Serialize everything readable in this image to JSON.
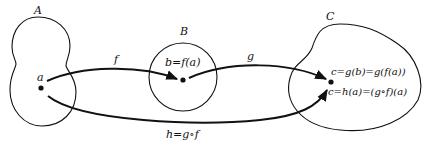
{
  "diagram": {
    "type": "function-composition",
    "sets": [
      {
        "id": "A",
        "label": "A"
      },
      {
        "id": "B",
        "label": "B"
      },
      {
        "id": "C",
        "label": "C"
      }
    ],
    "points": [
      {
        "id": "a",
        "label": "a",
        "set": "A"
      },
      {
        "id": "b",
        "label": "b=f(a)",
        "set": "B"
      },
      {
        "id": "c",
        "label_top": "c=g(b)=g(f(a))",
        "label_bottom": "c=h(a)=(g∘f)(a)",
        "set": "C"
      }
    ],
    "arrows": [
      {
        "id": "f",
        "label": "f",
        "from": "a",
        "to": "b"
      },
      {
        "id": "g",
        "label": "g",
        "from": "b",
        "to": "c"
      },
      {
        "id": "h",
        "label": "h=g∘f",
        "from": "a",
        "to": "c"
      }
    ],
    "colors": {
      "stroke": "#111111",
      "background": "#ffffff"
    }
  }
}
